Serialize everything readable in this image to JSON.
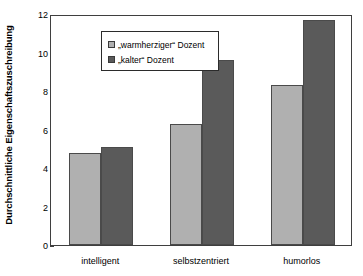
{
  "chart_data": {
    "type": "bar",
    "title": "",
    "xlabel": "",
    "ylabel": "Durchschnittliche Eigenschaftszuschreibung",
    "categories": [
      "intelligent",
      "selbstzentriert",
      "humorlos"
    ],
    "series": [
      {
        "name": "„warmherziger“ Dozent",
        "values": [
          4.8,
          6.3,
          8.3
        ],
        "color": "#b0b0b0"
      },
      {
        "name": "„kalter“ Dozent",
        "values": [
          5.1,
          9.6,
          11.7
        ],
        "color": "#5a5a5a"
      }
    ],
    "ylim": [
      0,
      12
    ],
    "yticks": [
      0,
      2,
      4,
      6,
      8,
      10,
      12
    ],
    "ytick_labels": [
      "0",
      "2",
      "4",
      "6",
      "8",
      "10",
      "12"
    ],
    "grid": false,
    "legend_position": "upper left",
    "legend_entries": [
      "„warmherziger“ Dozent",
      "„kalter“ Dozent"
    ]
  }
}
